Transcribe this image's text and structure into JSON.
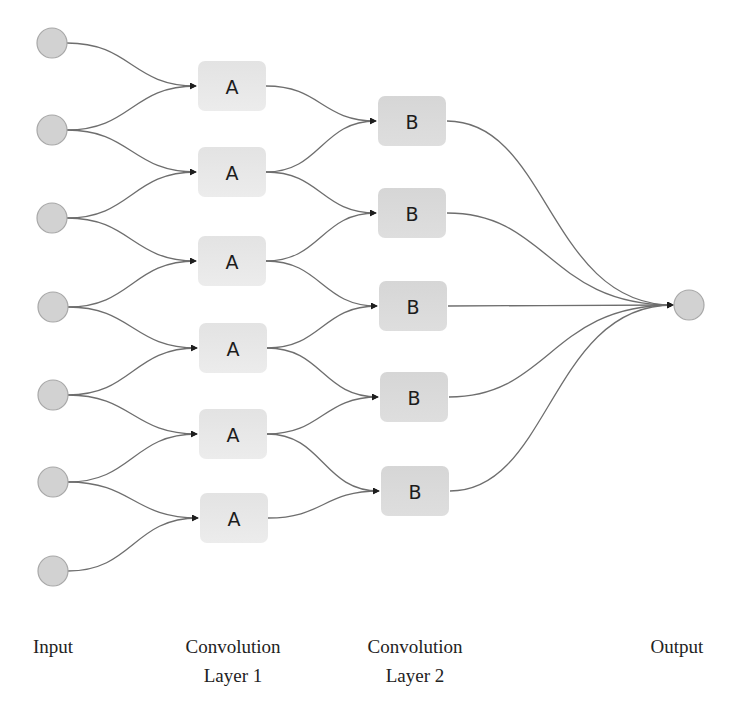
{
  "diagram": {
    "title": "",
    "colors": {
      "edge": "#6e6e6e",
      "node_fill": "#d2d2d2",
      "node_stroke": "#a8a8a8",
      "box_a_fill": "#e8e8e8",
      "box_b_fill": "#d9d9d9",
      "text": "#222222"
    },
    "input_nodes": [
      {
        "cx": 52,
        "cy": 43
      },
      {
        "cx": 52,
        "cy": 130
      },
      {
        "cx": 52,
        "cy": 218
      },
      {
        "cx": 53,
        "cy": 307
      },
      {
        "cx": 53,
        "cy": 395
      },
      {
        "cx": 53,
        "cy": 482
      },
      {
        "cx": 53,
        "cy": 571
      }
    ],
    "layer1_boxes": [
      {
        "label": "A",
        "x": 198,
        "cy": 86
      },
      {
        "label": "A",
        "x": 198,
        "cy": 172
      },
      {
        "label": "A",
        "x": 198,
        "cy": 261
      },
      {
        "label": "A",
        "x": 199,
        "cy": 348
      },
      {
        "label": "A",
        "x": 199,
        "cy": 434
      },
      {
        "label": "A",
        "x": 200,
        "cy": 518
      }
    ],
    "layer2_boxes": [
      {
        "label": "B",
        "x": 378,
        "cy": 121
      },
      {
        "label": "B",
        "x": 378,
        "cy": 213
      },
      {
        "label": "B",
        "x": 379,
        "cy": 306
      },
      {
        "label": "B",
        "x": 380,
        "cy": 397
      },
      {
        "label": "B",
        "x": 381,
        "cy": 491
      }
    ],
    "output_node": {
      "cx": 689,
      "cy": 305
    },
    "node_radius": 15,
    "box_width": 68,
    "box_height": 50,
    "labels": {
      "input": "Input",
      "conv1_line1": "Convolution",
      "conv1_line2": "Layer 1",
      "conv2_line1": "Convolution",
      "conv2_line2": "Layer 2",
      "output": "Output"
    }
  }
}
